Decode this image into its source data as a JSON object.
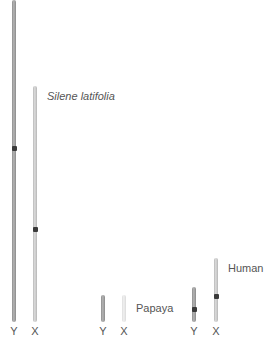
{
  "diagram": {
    "type": "sex-chromosome-size-comparison",
    "species": [
      {
        "name": "Silene latifolia",
        "italic": true,
        "chromosomes": [
          {
            "label": "Y",
            "top": 0,
            "bottom": 322,
            "centromere": 148,
            "shade": "dark"
          },
          {
            "label": "X",
            "top": 86,
            "bottom": 322,
            "centromere": 229,
            "shade": "light"
          }
        ]
      },
      {
        "name": "Papaya",
        "italic": false,
        "chromosomes": [
          {
            "label": "Y",
            "top": 295,
            "bottom": 322,
            "centromere": null,
            "shade": "dark"
          },
          {
            "label": "X",
            "top": 295,
            "bottom": 322,
            "centromere": null,
            "shade": "pale"
          }
        ]
      },
      {
        "name": "Human",
        "italic": false,
        "chromosomes": [
          {
            "label": "Y",
            "top": 287,
            "bottom": 322,
            "centromere": 309,
            "shade": "dark"
          },
          {
            "label": "X",
            "top": 258,
            "bottom": 322,
            "centromere": 296,
            "shade": "light"
          }
        ]
      }
    ],
    "labels": {
      "silene": "Silene latifolia",
      "papaya": "Papaya",
      "human": "Human",
      "y": "Y",
      "x": "X"
    }
  }
}
